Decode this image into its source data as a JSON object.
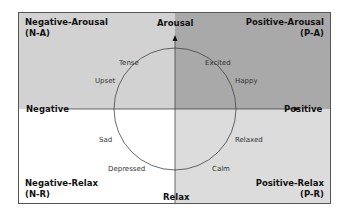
{
  "colors": {
    "q_negative_arousal": "#d2d2d2",
    "q_positive_arousal": "#a9a9a9",
    "q_negative_relax": "#ffffff",
    "q_positive_relax": "#dcdcdc",
    "lines": "#444444"
  },
  "quadrants": {
    "top_left": {
      "title": "Negative-Arousal",
      "code": "(N-A)"
    },
    "top_right": {
      "title": "Positive-Arousal",
      "code": "(P-A)"
    },
    "bottom_left": {
      "title": "Negative-Relax",
      "code": "(N-R)"
    },
    "bottom_right": {
      "title": "Positive-Relax",
      "code": "(P-R)"
    }
  },
  "axes": {
    "top": "Arousal",
    "bottom": "Relax",
    "left": "Negative",
    "right": "Positive"
  },
  "emotions": {
    "tense": "Tense",
    "excited": "Excited",
    "upset": "Upset",
    "happy": "Happy",
    "sad": "Sad",
    "relaxed": "Relaxed",
    "depressed": "Depressed",
    "calm": "Calm"
  }
}
